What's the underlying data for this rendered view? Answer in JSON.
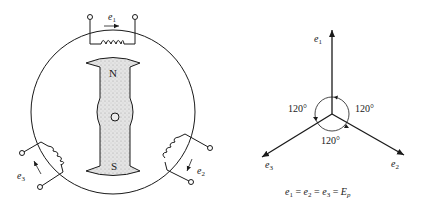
{
  "generator_diagram": {
    "coil_top": {
      "label": "e",
      "subscript": "1"
    },
    "coil_right": {
      "label": "e",
      "subscript": "2"
    },
    "coil_left": {
      "label": "e",
      "subscript": "3"
    },
    "rotor": {
      "north_label": "N",
      "south_label": "S"
    }
  },
  "phasor_diagram": {
    "phasors": [
      {
        "name": "e",
        "subscript": "1",
        "angle_deg": 90
      },
      {
        "name": "e",
        "subscript": "2",
        "angle_deg": -30
      },
      {
        "name": "e",
        "subscript": "3",
        "angle_deg": 210
      }
    ],
    "angle_labels": [
      "120°",
      "120°",
      "120°"
    ],
    "equation": {
      "parts": [
        "e",
        "1",
        " = ",
        "e",
        "2",
        " = ",
        "e",
        "3",
        " = ",
        "E",
        "p"
      ]
    }
  }
}
